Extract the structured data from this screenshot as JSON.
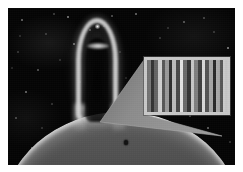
{
  "figure": {
    "domain": "astronomy-photograph",
    "background_color": "#050505",
    "page_color": "#ffffff",
    "plate": {
      "x": 8,
      "y": 8,
      "width": 227,
      "height": 157
    }
  },
  "scene": {
    "space": {
      "label": "star field",
      "color": "#050505"
    },
    "stars": {
      "label": "background stars",
      "color": "#e8e8e8",
      "count": 40
    },
    "limb": {
      "label": "solar limb",
      "highlight_color": "#f2f2f2",
      "body_color": "#8f8f8f",
      "shadow_color": "#6e6e6e"
    },
    "sunspot": {
      "label": "dark surface feature",
      "color": "#121212"
    },
    "loop": {
      "label": "prominence loop",
      "ridge_color": "#d6d6d6",
      "cavity_color": "#050505",
      "blob_label": "bright core blob",
      "blob_color": "#ffffff",
      "apex_label": "apex knot"
    }
  },
  "callout": {
    "label": "magnification wedge",
    "fill_color": "#8a8a8a",
    "edge_color": "#b0b0b0",
    "apex_x": 92,
    "apex_y": 114
  },
  "inset": {
    "label": "magnified detail panel",
    "border_color": "#c9c9c9",
    "background_color": "#3a3a3a",
    "bounds": {
      "x": 136,
      "y": 49,
      "width": 86,
      "height": 58
    },
    "pattern_type": "vertical-stripes",
    "stripe_count": 22,
    "stripe_values": [
      "#8f8f8f",
      "#3b3b3b",
      "#6d6d6d",
      "#d2d2d2",
      "#585858",
      "#9a9a9a",
      "#2f2f2f",
      "#bdbdbd",
      "#4a4a4a",
      "#e2e2e2",
      "#6a6a6a",
      "#343434",
      "#c6c6c6",
      "#7e7e7e",
      "#3f3f3f",
      "#d8d8d8",
      "#545454",
      "#a6a6a6",
      "#2b2b2b",
      "#b4b4b4",
      "#626262",
      "#ededed"
    ]
  },
  "chart_data": {
    "type": "heatmap",
    "xlabel": "",
    "ylabel": "",
    "categories": [
      "1",
      "2",
      "3",
      "4",
      "5",
      "6",
      "7",
      "8",
      "9",
      "10",
      "11",
      "12",
      "13",
      "14",
      "15",
      "16",
      "17",
      "18",
      "19",
      "20",
      "21",
      "22"
    ],
    "values": [
      0.56,
      0.23,
      0.43,
      0.82,
      0.35,
      0.6,
      0.18,
      0.74,
      0.29,
      0.89,
      0.42,
      0.2,
      0.78,
      0.49,
      0.25,
      0.85,
      0.33,
      0.65,
      0.17,
      0.71,
      0.38,
      0.93
    ],
    "ylim": [
      0,
      1
    ],
    "grid": false,
    "legend": "none"
  }
}
